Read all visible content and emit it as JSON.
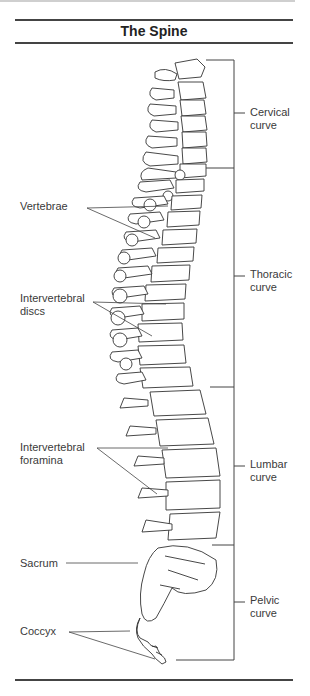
{
  "title": "The Spine",
  "left_labels": {
    "vertebrae": "Vertebrae",
    "discs_l1": "Intervertebral",
    "discs_l2": "discs",
    "foramina_l1": "Intervertebral",
    "foramina_l2": "foramina",
    "sacrum": "Sacrum",
    "coccyx": "Coccyx"
  },
  "curves": {
    "cervical": {
      "l1": "Cervical",
      "l2": "curve"
    },
    "thoracic": {
      "l1": "Thoracic",
      "l2": "curve"
    },
    "lumbar": {
      "l1": "Lumbar",
      "l2": "curve"
    },
    "pelvic": {
      "l1": "Pelvic",
      "l2": "curve"
    }
  },
  "colors": {
    "line": "#444444",
    "drawing": "#333333",
    "text": "#3a3a3a"
  }
}
